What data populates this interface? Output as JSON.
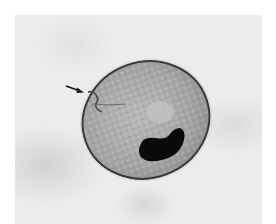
{
  "image": {
    "type": "micrograph",
    "subject": "Ciliate cyst with kidney-shaped dark macronucleus",
    "annotation": {
      "kind": "arrow",
      "points_to": "cyst wall / cytostome region",
      "direction": "right"
    },
    "colors": {
      "background": "#ececec",
      "cell_fill": "#a8a8a8",
      "cell_wall": "#3a3a3a",
      "nucleus": "#0a0a0a",
      "border": "#ffffff"
    }
  }
}
